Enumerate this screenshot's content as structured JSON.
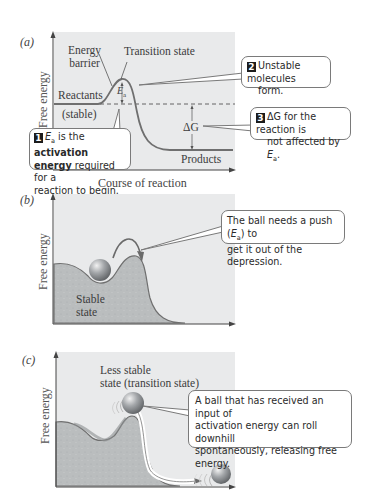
{
  "panels": {
    "a": {
      "label": "(a)",
      "y_axis_label": "Free energy",
      "x_axis_label": "Course of reaction",
      "labels": {
        "energy_barrier_line1": "Energy",
        "energy_barrier_line2": "barrier",
        "transition_state": "Transition state",
        "reactants": "Reactants",
        "stable": "(stable)",
        "ea": "E",
        "ea_sub": "a",
        "delta_g": "ΔG",
        "products": "Products"
      },
      "callouts": [
        {
          "number": "1",
          "parts": {
            "e": "E",
            "sub": "a",
            "text1": " is the ",
            "bold1": "activation",
            "bold2": "energy",
            "text2": " required for a",
            "text3": "reaction to begin."
          }
        },
        {
          "number": "2",
          "line1": "Unstable molecules",
          "line2": "form."
        },
        {
          "number": "3",
          "line1": "ΔG for the reaction is",
          "line2a": "not affected by ",
          "line2_e": "E",
          "line2_sub": "a",
          "line2_end": "."
        }
      ]
    },
    "b": {
      "label": "(b)",
      "y_axis_label": "Free energy",
      "state_label_line1": "Stable",
      "state_label_line2": "state",
      "callout": {
        "text1": "The ball needs a push (",
        "e": "E",
        "sub": "a",
        "text2": ") to",
        "line2": "get it out of the depression."
      }
    },
    "c": {
      "label": "(c)",
      "y_axis_label": "Free energy",
      "state_label_line1": "Less stable",
      "state_label_line2": "state (transition state)",
      "callout": {
        "line1": "A ball that has received an input of",
        "line2": "activation energy can roll downhill",
        "line3": "spontaneously, releasing free",
        "line4": "energy."
      }
    }
  },
  "colors": {
    "plot_bg": "#e8e9ea",
    "terrain_fill": "#b9bcbd",
    "curve": "#6f6f6f",
    "ball": "#8c8f92",
    "arrow": "#6a6a6a",
    "badge": "#1c1c1c"
  }
}
